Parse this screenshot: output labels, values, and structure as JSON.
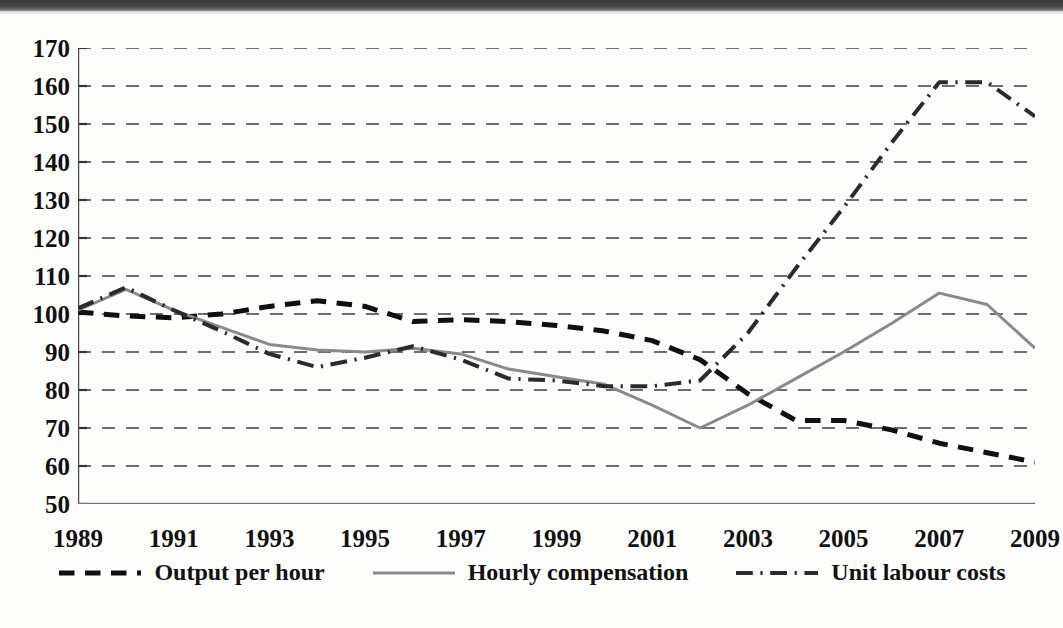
{
  "figure": {
    "background_color": "#fdfdfc",
    "plot_background_color": "#ffffff",
    "scan_edge_color": "#3a3a3a"
  },
  "chart_data": {
    "type": "line",
    "title": "",
    "subtitle": "",
    "xlabel": "",
    "ylabel": "",
    "xlim": [
      1989,
      2009
    ],
    "ylim": [
      50,
      170
    ],
    "ytick_step": 10,
    "grid": true,
    "grid_style": "dashed-horizontal",
    "grid_color": "#6d6d6d",
    "legend_position": "bottom-center",
    "x": [
      1989,
      1990,
      1991,
      1992,
      1993,
      1994,
      1995,
      1996,
      1997,
      1998,
      1999,
      2000,
      2001,
      2002,
      2003,
      2004,
      2005,
      2006,
      2007,
      2008,
      2009
    ],
    "xtick_labels": [
      "1989",
      "1991",
      "1993",
      "1995",
      "1997",
      "1999",
      "2001",
      "2003",
      "2005",
      "2007",
      "2009"
    ],
    "ytick_labels": [
      "170",
      "160",
      "150",
      "140",
      "130",
      "120",
      "110",
      "100",
      "90",
      "80",
      "70",
      "60",
      "50"
    ],
    "series": [
      {
        "name": "Output per hour",
        "style": "dashed",
        "color": "#101010",
        "width": 5,
        "values": [
          100.5,
          99.5,
          99.0,
          100.0,
          102.0,
          103.5,
          102.0,
          98.0,
          98.5,
          98.0,
          97.0,
          95.5,
          93.0,
          88.0,
          79.0,
          72.0,
          72.0,
          69.5,
          66.0,
          63.5,
          61.0
        ]
      },
      {
        "name": "Hourly compensation",
        "style": "solid",
        "color": "#8a8a8a",
        "width": 3,
        "values": [
          101.0,
          106.5,
          101.0,
          96.5,
          92.0,
          90.5,
          90.0,
          91.0,
          89.5,
          85.5,
          83.5,
          81.5,
          76.0,
          70.0,
          76.0,
          83.0,
          90.0,
          97.5,
          105.5,
          102.5,
          91.0
        ]
      },
      {
        "name": "Unit labour costs",
        "style": "dash-dot",
        "color": "#2b2b2b",
        "width": 4,
        "values": [
          101.5,
          107.0,
          101.0,
          95.5,
          89.5,
          86.0,
          88.5,
          91.5,
          88.0,
          83.0,
          82.5,
          81.0,
          81.0,
          82.5,
          95.0,
          112.0,
          128.0,
          145.0,
          161.0,
          161.0,
          152.0
        ]
      }
    ]
  },
  "legend": {
    "items": [
      {
        "label": "Output per hour",
        "marker": "dashed-line-marker"
      },
      {
        "label": "Hourly compensation",
        "marker": "solid-line-marker"
      },
      {
        "label": "Unit labour costs",
        "marker": "dash-dot-line-marker"
      }
    ]
  }
}
